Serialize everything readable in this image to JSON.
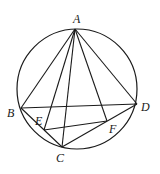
{
  "figure": {
    "stroke_color": "#1a1a1a",
    "background": "#ffffff",
    "circle": {
      "cx": 77,
      "cy": 89,
      "r": 60
    },
    "points": {
      "A": {
        "x": 75,
        "y": 29,
        "label": "A",
        "lx": 73,
        "ly": 23
      },
      "B": {
        "x": 21,
        "y": 108,
        "label": "B",
        "lx": 7,
        "ly": 117
      },
      "C": {
        "x": 62,
        "y": 147,
        "label": "C",
        "lx": 56,
        "ly": 162
      },
      "D": {
        "x": 137,
        "y": 104,
        "label": "D",
        "lx": 141,
        "ly": 111
      },
      "E": {
        "x": 44,
        "y": 130,
        "label": "E",
        "lx": 35,
        "ly": 125
      },
      "F": {
        "x": 107,
        "y": 121,
        "label": "F",
        "lx": 109,
        "ly": 133
      }
    },
    "segments": [
      [
        "A",
        "B"
      ],
      [
        "A",
        "D"
      ],
      [
        "A",
        "E"
      ],
      [
        "A",
        "C"
      ],
      [
        "A",
        "F"
      ],
      [
        "B",
        "D"
      ],
      [
        "B",
        "C"
      ],
      [
        "C",
        "D"
      ],
      [
        "E",
        "F"
      ]
    ]
  }
}
